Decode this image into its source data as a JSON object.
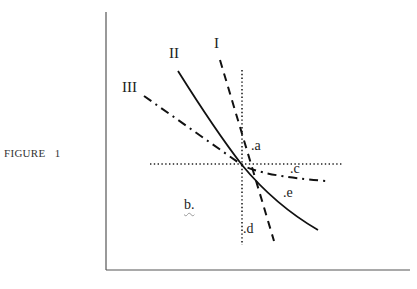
{
  "figure": {
    "caption": "FIGURE   1",
    "curves": [
      {
        "id": "I",
        "label": "I",
        "style": "dashed"
      },
      {
        "id": "II",
        "label": "II",
        "style": "solid"
      },
      {
        "id": "III",
        "label": "III",
        "style": "dash-dot"
      }
    ],
    "points": {
      "a": ".a",
      "b": "b.",
      "c": ".c",
      "d": ".d",
      "e": ".e"
    },
    "colors": {
      "axis": "#555555",
      "line": "#111111",
      "text": "#222222"
    }
  }
}
